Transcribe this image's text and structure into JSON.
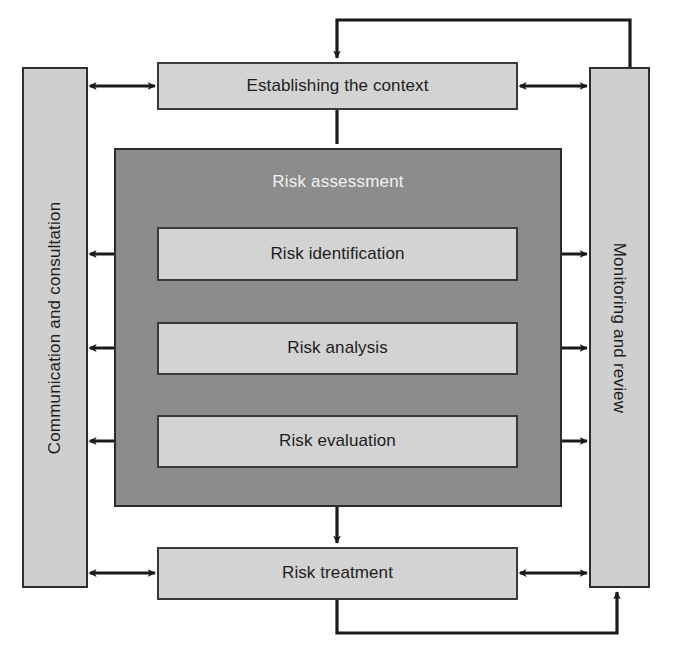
{
  "diagram": {
    "type": "process-flow",
    "colors": {
      "node_fill": "#d3d3d3",
      "node_border": "#3a3a3a",
      "group_fill": "#8c8c8c",
      "group_border": "#2b2b2b",
      "panel_fill": "#cfcfcf",
      "panel_border": "#2e2e2e",
      "group_title_text": "#f2f2f2",
      "node_text": "#1d1d1d",
      "connector": "#1a1a1a",
      "background": "#ffffff"
    }
  },
  "panels": {
    "left": {
      "label": "Communication and consultation",
      "orientation": "vertical-bottom-to-top"
    },
    "right": {
      "label": "Monitoring and review",
      "orientation": "vertical-top-to-bottom"
    }
  },
  "nodes": {
    "context": {
      "label": "Establishing the context"
    },
    "treatment": {
      "label": "Risk treatment"
    }
  },
  "group": {
    "assessment": {
      "label": "Risk assessment",
      "steps": [
        {
          "label": "Risk identification"
        },
        {
          "label": "Risk analysis"
        },
        {
          "label": "Risk evaluation"
        }
      ]
    }
  },
  "connectors": [
    {
      "name": "context-to-assessment",
      "kind": "arrow-down"
    },
    {
      "name": "assessment-to-identification",
      "kind": "arrow-down"
    },
    {
      "name": "identification-to-analysis",
      "kind": "arrow-down"
    },
    {
      "name": "analysis-to-evaluation",
      "kind": "arrow-down"
    },
    {
      "name": "assessment-to-treatment",
      "kind": "arrow-down"
    },
    {
      "name": "context-left-link",
      "kind": "double-arrow-horizontal"
    },
    {
      "name": "context-right-link",
      "kind": "double-arrow-horizontal"
    },
    {
      "name": "identification-left-link",
      "kind": "double-arrow-horizontal"
    },
    {
      "name": "identification-right-link",
      "kind": "double-arrow-horizontal"
    },
    {
      "name": "analysis-left-link",
      "kind": "double-arrow-horizontal"
    },
    {
      "name": "analysis-right-link",
      "kind": "double-arrow-horizontal"
    },
    {
      "name": "evaluation-left-link",
      "kind": "double-arrow-horizontal"
    },
    {
      "name": "evaluation-right-link",
      "kind": "double-arrow-horizontal"
    },
    {
      "name": "treatment-left-link",
      "kind": "double-arrow-horizontal"
    },
    {
      "name": "treatment-right-link",
      "kind": "double-arrow-horizontal"
    },
    {
      "name": "monitoring-feedback-top",
      "kind": "loop-arrow-to-context"
    },
    {
      "name": "treatment-feedback-bottom",
      "kind": "loop-arrow-to-monitoring"
    }
  ]
}
